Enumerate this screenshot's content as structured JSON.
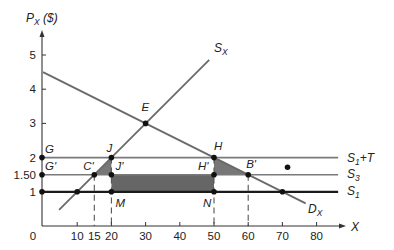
{
  "figure": {
    "y_axis_title": {
      "base": "P",
      "sub": "X",
      "rest": " ($)"
    },
    "x_axis_title": {
      "base": "X",
      "sub": "",
      "rest": ""
    }
  },
  "chart_data": {
    "type": "line",
    "title": "",
    "xlabel": "X",
    "ylabel": "P_X ($)",
    "xlim": [
      0,
      88
    ],
    "ylim": [
      0,
      5.65
    ],
    "grid": false,
    "legend": "inline labels at right end of lines",
    "x_ticks": [
      {
        "v": 0,
        "label": "0"
      },
      {
        "v": 10,
        "label": "10"
      },
      {
        "v": 15,
        "label": "15"
      },
      {
        "v": 20,
        "label": "20"
      },
      {
        "v": 30,
        "label": "30"
      },
      {
        "v": 40,
        "label": "40"
      },
      {
        "v": 50,
        "label": "50"
      },
      {
        "v": 60,
        "label": "60"
      },
      {
        "v": 70,
        "label": "70"
      },
      {
        "v": 80,
        "label": "80"
      }
    ],
    "y_ticks": [
      {
        "v": 1,
        "label": "1"
      },
      {
        "v": 1.5,
        "label": "1.50"
      },
      {
        "v": 2,
        "label": "2"
      },
      {
        "v": 3,
        "label": "3"
      },
      {
        "v": 4,
        "label": "4"
      },
      {
        "v": 5,
        "label": "5"
      }
    ],
    "series": [
      {
        "id": "demand",
        "name": "D_X",
        "label": {
          "base": "D",
          "sub": "X",
          "rest": ""
        },
        "equation": "P = 4.5 - 0.05X",
        "points": [
          [
            0,
            4.5
          ],
          [
            30,
            3
          ],
          [
            50,
            2
          ],
          [
            60,
            1.5
          ],
          [
            70,
            1
          ],
          [
            76.8,
            0.66
          ]
        ],
        "color": "#6a6a6a",
        "width": 1.8,
        "label_pos": [
          308,
          213
        ]
      },
      {
        "id": "supply",
        "name": "S_X",
        "label": {
          "base": "S",
          "sub": "X",
          "rest": ""
        },
        "equation": "P = 0.1X",
        "points": [
          [
            4.7,
            0.47
          ],
          [
            10,
            1
          ],
          [
            15,
            1.5
          ],
          [
            20,
            2
          ],
          [
            30,
            3
          ],
          [
            48.6,
            4.86
          ]
        ],
        "color": "#6a6a6a",
        "width": 1.8,
        "label_pos": [
          214,
          52
        ]
      },
      {
        "id": "s1-plus-t",
        "name": "S_1+T",
        "label": {
          "base": "S",
          "sub": "1",
          "rest": "+T"
        },
        "points": [
          [
            0,
            2
          ],
          [
            86.3,
            2
          ]
        ],
        "color": "#7a7a7a",
        "width": 1.6,
        "label_pos": [
          347,
          162
        ]
      },
      {
        "id": "s3",
        "name": "S_3",
        "label": {
          "base": "S",
          "sub": "3",
          "rest": ""
        },
        "points": [
          [
            0,
            1.5
          ],
          [
            86.3,
            1.5
          ]
        ],
        "color": "#7a7a7a",
        "width": 1.6,
        "label_pos": [
          347,
          178
        ]
      },
      {
        "id": "s1",
        "name": "S_1",
        "label": {
          "base": "S",
          "sub": "1",
          "rest": ""
        },
        "points": [
          [
            0,
            1
          ],
          [
            86.3,
            1
          ]
        ],
        "color": "#1a1a1a",
        "width": 2.2,
        "label_pos": [
          347,
          195
        ]
      }
    ],
    "shaded_regions": [
      {
        "id": "triangle-c-j-j",
        "vertices": [
          [
            15,
            1.5
          ],
          [
            20,
            2
          ],
          [
            20,
            1.5
          ]
        ],
        "color": "#777777"
      },
      {
        "id": "rectangle-j-h-n-m",
        "vertices": [
          [
            20,
            1.5
          ],
          [
            50,
            1.5
          ],
          [
            50,
            1
          ],
          [
            20,
            1
          ]
        ],
        "color": "#666666"
      },
      {
        "id": "triangle-h-h-b",
        "vertices": [
          [
            50,
            2
          ],
          [
            50,
            1.5
          ],
          [
            60,
            1.5
          ]
        ],
        "color": "#777777"
      }
    ],
    "dashed_guides": [
      {
        "x": 15,
        "from": 1.5
      },
      {
        "x": 20,
        "from": 2
      },
      {
        "x": 50,
        "from": 2
      },
      {
        "x": 60,
        "from": 1.5
      }
    ],
    "points": [
      {
        "label": "E",
        "x": 30,
        "y": 3,
        "dx": -4,
        "dy": -12
      },
      {
        "label": "G",
        "x": 0,
        "y": 2,
        "dx": 3,
        "dy": -5
      },
      {
        "label": "G'",
        "x": 0,
        "y": 1.5,
        "dx": 3,
        "dy": -5
      },
      {
        "label": "",
        "x": 0,
        "y": 1,
        "dx": 0,
        "dy": 0
      },
      {
        "label": "C'",
        "x": 15,
        "y": 1.5,
        "dx": -11,
        "dy": -5
      },
      {
        "label": "J",
        "x": 20,
        "y": 2,
        "dx": -5,
        "dy": -6
      },
      {
        "label": "J'",
        "x": 20,
        "y": 1.5,
        "dx": 4,
        "dy": -5
      },
      {
        "label": "M",
        "x": 20,
        "y": 1,
        "dx": 4,
        "dy": 15
      },
      {
        "label": "",
        "x": 10,
        "y": 1,
        "dx": 0,
        "dy": 0
      },
      {
        "label": "H",
        "x": 50,
        "y": 2,
        "dx": 0,
        "dy": -8
      },
      {
        "label": "H'",
        "x": 50,
        "y": 1.5,
        "dx": -16,
        "dy": -5
      },
      {
        "label": "N",
        "x": 50,
        "y": 1,
        "dx": -11,
        "dy": 15
      },
      {
        "label": "B'",
        "x": 60,
        "y": 1.5,
        "dx": -2,
        "dy": -7
      },
      {
        "label": "",
        "x": 70,
        "y": 1,
        "dx": 0,
        "dy": 0
      },
      {
        "label": "",
        "x": 71.5,
        "y": 1.72,
        "dx": 0,
        "dy": 0
      }
    ]
  }
}
